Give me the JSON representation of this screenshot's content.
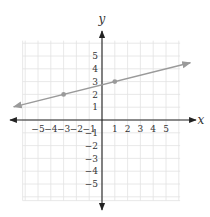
{
  "chart_data": {
    "type": "line",
    "title": "",
    "xlabel": "x",
    "ylabel": "y",
    "xlim": [
      -6.5,
      6.5
    ],
    "ylim": [
      -6.2,
      6.2
    ],
    "grid": true,
    "x_ticks": [
      -5,
      -4,
      -3,
      -2,
      -1,
      1,
      2,
      3,
      4,
      5
    ],
    "y_ticks": [
      -5,
      -4,
      -3,
      -2,
      -1,
      1,
      2,
      3,
      4,
      5
    ],
    "x_tick_labels": [
      "−5",
      "−4",
      "−3",
      "−2",
      "−1",
      "1",
      "2",
      "3",
      "4",
      "5"
    ],
    "y_tick_labels": [
      "−5",
      "−4",
      "−3",
      "−2",
      "−1",
      "1",
      "2",
      "3",
      "4",
      "5"
    ],
    "series": [
      {
        "name": "line",
        "equation": "y = x/4 + 11/4",
        "slope": 0.25,
        "intercept": 2.75,
        "x_range": [
          -6.9,
          6.9
        ],
        "arrows": "both",
        "color": "#9a9a9a",
        "points": [
          {
            "x": -3,
            "y": 2
          },
          {
            "x": 1,
            "y": 3
          }
        ]
      }
    ]
  },
  "style": {
    "grid_color": "#e2e2e2",
    "axis_color": "#222222",
    "line_color": "#9a9a9a",
    "point_color": "#9a9a9a",
    "label_color": "#333333"
  }
}
